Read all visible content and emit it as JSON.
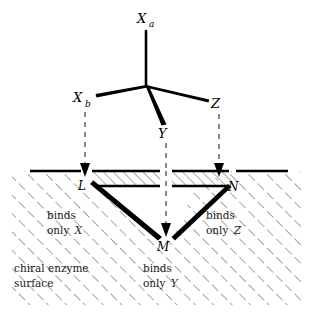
{
  "figure": {
    "molecule": {
      "center_label": "",
      "substituents": [
        {
          "id": "Xa",
          "base": "X",
          "sub": "a",
          "bond_style": "plain-up"
        },
        {
          "id": "Xb",
          "base": "X",
          "sub": "b",
          "bond_style": "bold-wedge-left"
        },
        {
          "id": "Y",
          "base": "Y",
          "sub": "",
          "bond_style": "bold-wedge-down"
        },
        {
          "id": "Z",
          "base": "Z",
          "sub": "",
          "bond_style": "plain-right"
        }
      ]
    },
    "binding_sites": [
      {
        "id": "L",
        "label": "L",
        "caption_line1": "binds",
        "caption_line2_prefix": "only ",
        "caption_line2_italic": "X"
      },
      {
        "id": "M",
        "label": "M",
        "caption_line1": "binds",
        "caption_line2_prefix": "only ",
        "caption_line2_italic": "Y"
      },
      {
        "id": "N",
        "label": "N",
        "caption_line1": "binds",
        "caption_line2_prefix": "only ",
        "caption_line2_italic": "Z"
      }
    ],
    "surface_caption": {
      "line1": "chiral enzyme",
      "line2": "surface"
    },
    "arrows": [
      {
        "from": "Xb",
        "to": "L"
      },
      {
        "from": "Y",
        "to": "M"
      },
      {
        "from": "Z",
        "to": "N"
      }
    ],
    "colors": {
      "ink": "#000000",
      "hatch": "#555555",
      "dashed": "#3a3a3a",
      "background": "#ffffff"
    }
  }
}
